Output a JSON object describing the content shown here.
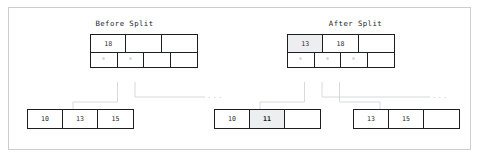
{
  "figure": {
    "type": "b-tree-node-split-diagram",
    "panels": [
      {
        "id": "before",
        "title": "Before Split",
        "internal_node": {
          "keys": [
            "18",
            "",
            ""
          ],
          "pointers": [
            "ptr",
            "ptr",
            "",
            ""
          ]
        },
        "leaves": [
          {
            "cells": [
              "10",
              "13",
              "15"
            ],
            "highlight_index": -1
          }
        ],
        "ellipsis": "..."
      },
      {
        "id": "after",
        "title": "After Split",
        "internal_node": {
          "keys": [
            "13",
            "18",
            ""
          ],
          "pointers": [
            "ptr",
            "ptr",
            "ptr",
            ""
          ],
          "highlight_key_index": 0
        },
        "leaves": [
          {
            "cells": [
              "10",
              "11",
              ""
            ],
            "highlight_index": 1
          },
          {
            "cells": [
              "13",
              "15",
              ""
            ],
            "highlight_index": -1
          }
        ],
        "ellipsis": "..."
      }
    ]
  },
  "before": {
    "title": "Before Split",
    "parent": {
      "key0": "18",
      "key1": "",
      "key2": ""
    },
    "leaf": {
      "c0": "10",
      "c1": "13",
      "c2": "15"
    },
    "ellipsis": "..."
  },
  "after": {
    "title": "After Split",
    "parent": {
      "key0": "13",
      "key1": "18",
      "key2": ""
    },
    "leaf_left": {
      "c0": "10",
      "c1": "11",
      "c2": ""
    },
    "leaf_right": {
      "c0": "13",
      "c1": "15",
      "c2": ""
    },
    "ellipsis": "..."
  },
  "colors": {
    "frame_border": "#c9ccd1",
    "node_border": "#1c1f24",
    "highlight_fill": "#eceef0",
    "connector": "#d7d9db",
    "text": "#23262b",
    "muted": "#c7cacd"
  }
}
